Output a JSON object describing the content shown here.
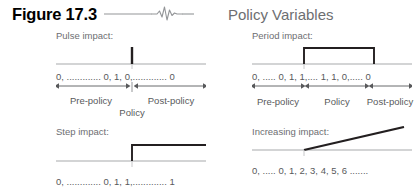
{
  "header": {
    "figure_number": "Figure 17.3",
    "title": "Policy Variables",
    "rule_icon": "ekg-squiggle-icon"
  },
  "colors": {
    "figure_number": "#000000",
    "title_gray": "#6d6e71",
    "body_gray": "#58595b",
    "baseline_gray": "#a7a9ac",
    "plot_black": "#231f20",
    "background": "#ffffff"
  },
  "panels": [
    {
      "id": "pulse",
      "title": "Pulse impact:",
      "plot_type": "pulse-spike",
      "sequence": "0, ............. 0, 1, 0,............. 0",
      "segments": [
        {
          "label": "Pre-policy"
        },
        {
          "label": "Post-policy"
        }
      ],
      "center_label": "Policy"
    },
    {
      "id": "period",
      "title": "Period impact:",
      "plot_type": "rectangular-pulse",
      "sequence": "0, ..... 0, 1, 1,.... 1, 1, 0,..... 0",
      "segments": [
        {
          "label": "Pre-policy"
        },
        {
          "label": "Policy"
        },
        {
          "label": "Post-policy"
        }
      ],
      "center_label": ""
    },
    {
      "id": "step",
      "title": "Step impact:",
      "plot_type": "step-up",
      "sequence": "0, ............. 0, 1, 1,............. 1",
      "segments": [],
      "center_label": ""
    },
    {
      "id": "increasing",
      "title": "Increasing impact:",
      "plot_type": "ramp",
      "sequence": "0, ..... 0, 1, 2, 3, 4, 5, 6 .......",
      "segments": [],
      "center_label": ""
    }
  ]
}
